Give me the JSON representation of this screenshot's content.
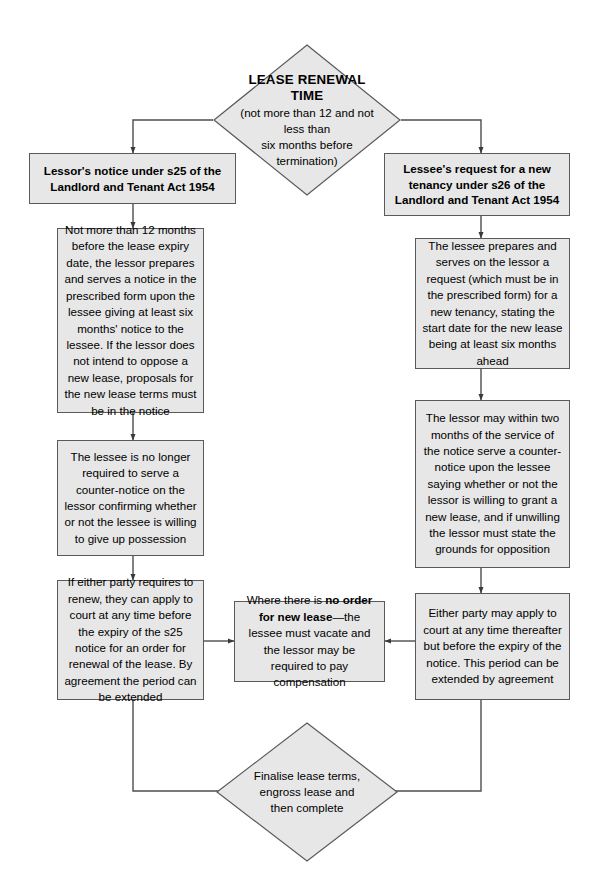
{
  "diagram": {
    "type": "flowchart",
    "title_node": {
      "shape": "diamond",
      "title": "LEASE RENEWAL TIME",
      "subtitle_line1": "(not more than 12 and not less than",
      "subtitle_line2": "six months before termination)"
    },
    "left_branch": {
      "header": "Lessor's notice under s25 of the Landlord and Tenant Act 1954",
      "step1": "Not more than 12 months before the lease expiry date, the lessor prepares and serves a notice in the prescribed form upon the lessee giving at least six months' notice to the lessee. If the lessor does not intend to oppose a new lease, proposals for the new lease terms must be in the notice",
      "step2": "The lessee is no longer required to serve a counter-notice on the lessor confirming whether or not the lessee is willing to give up possession",
      "step3": "If either party requires to renew, they can apply to court at any time before the expiry of the s25 notice for an order for renewal of the lease. By agreement the period can be extended"
    },
    "right_branch": {
      "header": "Lessee's request for a new tenancy under s26 of the Landlord and Tenant Act 1954",
      "step1": "The lessee prepares and serves on the lessor a request (which must be in the prescribed form) for a new tenancy, stating the start date for the new lease being at least six months ahead",
      "step2": "The lessor may within two months of the service of the notice serve a counter-notice upon the lessee saying whether or not the lessor is willing to grant a new lease, and if unwilling the lessor must state the grounds for opposition",
      "step3": "Either party may apply to court at any time thereafter but before the expiry of the notice. This period can be extended by agreement"
    },
    "centre_note": {
      "prefix": "Where there is ",
      "bold": "no order for new lease",
      "suffix": "—the lessee must vacate and the lessor may be required to pay compensation"
    },
    "end_node": {
      "shape": "diamond",
      "line1": "Finalise lease terms,",
      "line2": "engross lease and",
      "line3": "then complete"
    },
    "colors": {
      "node_fill": "#e7e7e7",
      "node_border": "#5a5a5a",
      "connector": "#4d4d4d",
      "background": "#ffffff",
      "text": "#000000"
    }
  }
}
